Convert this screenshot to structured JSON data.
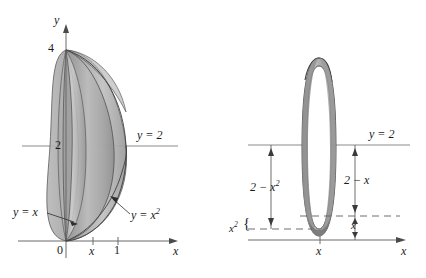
{
  "figure": {
    "type": "math-diagram",
    "background_color": "#ffffff",
    "ink_color": "#1a1a1a",
    "surface_fill_light": "#c3c3c3",
    "surface_fill_mid": "#a8a8a8",
    "surface_fill_dark": "#8d8d8d",
    "surface_fill_darker": "#777777",
    "axis_color": "#6b6b6b",
    "dash_color": "#5e5e5e"
  },
  "left_panel": {
    "name": "solid-of-revolution-panel",
    "axes": {
      "y_axis_label": "y",
      "x_axis_label": "x",
      "origin_label": "0"
    },
    "y_ticks": [
      {
        "label": "4",
        "value": 4
      },
      {
        "label": "2",
        "value": 2
      }
    ],
    "x_ticks": [
      {
        "label": "x",
        "value": "x"
      },
      {
        "label": "1",
        "value": 1
      }
    ],
    "annotations": [
      {
        "name": "line-y-equals-2-label",
        "text": "y = 2"
      },
      {
        "name": "curve-y-equals-x-label",
        "text": "y = x"
      },
      {
        "name": "curve-y-equals-x-squared-label",
        "text": "y = x",
        "exponent": "2"
      }
    ]
  },
  "right_panel": {
    "name": "washer-cross-section-panel",
    "axes": {
      "x_axis_label": "x"
    },
    "x_ticks": [
      {
        "label": "x",
        "value": "x"
      }
    ],
    "annotations": [
      {
        "name": "line-y-equals-2-label",
        "text": "y = 2"
      },
      {
        "name": "outer-radius-label",
        "text": "2 − x",
        "exponent": "2"
      },
      {
        "name": "inner-radius-label",
        "text": "2 − x"
      },
      {
        "name": "height-x-squared-label",
        "text": "x",
        "exponent": "2"
      },
      {
        "name": "height-x-label",
        "text": "x"
      },
      {
        "name": "brace-glyph",
        "text": "{"
      }
    ]
  }
}
